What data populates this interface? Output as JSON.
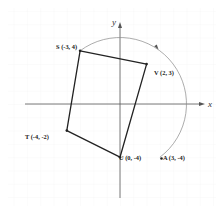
{
  "diagram": {
    "type": "coordinate-plane-rotation",
    "axes": {
      "x_label": "x",
      "y_label": "y"
    },
    "origin_px": [
      120,
      104
    ],
    "unit_px": 13.3,
    "colors": {
      "polygon": "#222222",
      "axis": "#555555",
      "arc": "#888888",
      "grid": "#f0f0f0"
    },
    "points": [
      {
        "id": "S",
        "label": "S (-3, 4)",
        "x": -3,
        "y": 4
      },
      {
        "id": "V",
        "label": "V (2, 3)",
        "x": 2,
        "y": 3
      },
      {
        "id": "U",
        "label": "U (0, -4)",
        "x": 0,
        "y": -4
      },
      {
        "id": "T",
        "label": "T (-4, -2)",
        "x": -4,
        "y": -2
      },
      {
        "id": "A",
        "label": "A (3, -4)",
        "x": 3,
        "y": -4
      }
    ],
    "polygon": [
      "S",
      "V",
      "U",
      "T"
    ],
    "arc": {
      "from": "S",
      "to": "A",
      "center": [
        0,
        0
      ],
      "radius": 5,
      "direction": "clockwise",
      "arrow": true
    }
  }
}
